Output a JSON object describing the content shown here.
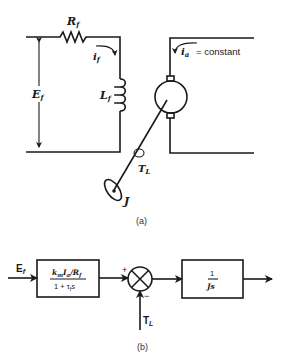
{
  "circuit": {
    "resistor_label": "R",
    "resistor_sub": "f",
    "field_current_label": "i",
    "field_current_sub": "f",
    "voltage_label": "E",
    "voltage_sub": "f",
    "inductor_label": "L",
    "inductor_sub": "f",
    "armature_current_label": "i",
    "armature_current_sub": "a",
    "armature_current_suffix": "= constant",
    "load_torque_label": "T",
    "load_torque_sub": "L",
    "inertia_label": "J",
    "caption": "(a)"
  },
  "block_diagram": {
    "input_label": "E",
    "input_sub": "f",
    "block1": {
      "numerator": "k_m I_a / R_f",
      "num_k": "k",
      "num_k_sub": "m",
      "num_I": "I",
      "num_I_sub": "a",
      "num_R": "/R",
      "num_R_sub": "f",
      "denominator_prefix": "1 + τ",
      "den_tau_sub": "f",
      "denominator_suffix": "s"
    },
    "sum_plus": "+",
    "sum_minus": "−",
    "disturbance_label": "T",
    "disturbance_sub": "L",
    "block2": {
      "numerator": "1",
      "denominator": "Js"
    },
    "caption": "(b)"
  },
  "colors": {
    "line": "#1a1a1a",
    "background": "#ffffff"
  }
}
